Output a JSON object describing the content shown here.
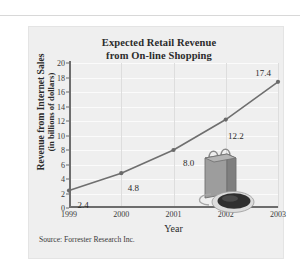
{
  "page": {
    "background_color": "#ffffff",
    "panel_color": "#efefef",
    "divider_color": "#d8d8d8"
  },
  "figure": {
    "source_note": "Source: Forrester Research Inc.",
    "illustration_name": "shopping-bag-and-computer-mouse",
    "illustration_colors": {
      "bag": "#9a9a9a",
      "bag_side": "#7d7d7d",
      "mouse": "#2e2e2e",
      "mouse_rim": "#d0d0d0"
    }
  },
  "chart_data": {
    "type": "line",
    "title": "Expected Retail Revenue from On-line Shopping",
    "title_line1": "Expected Retail Revenue",
    "title_line2": "from On-line Shopping",
    "xlabel": "Year",
    "ylabel": "Revenue from Internet Sales",
    "ylabel_line1": "Revenue from Internet Sales",
    "ylabel_line2": "(in billions of dollars)",
    "x": [
      "1999",
      "2000",
      "2001",
      "2002",
      "2003"
    ],
    "categories": [
      "1999",
      "2000",
      "2001",
      "2002",
      "2003"
    ],
    "values": [
      2.4,
      4.8,
      8.0,
      12.2,
      17.4
    ],
    "point_labels": [
      "2.4",
      "4.8",
      "8.0",
      "12.2",
      "17.4"
    ],
    "xtick_labels": [
      "1999",
      "2000",
      "2001",
      "2002",
      "2003"
    ],
    "ytick_labels": [
      "0",
      "2",
      "4",
      "6",
      "8",
      "10",
      "12",
      "14",
      "16",
      "18",
      "20"
    ],
    "ytick_values": [
      0,
      2,
      4,
      6,
      8,
      10,
      12,
      14,
      16,
      18,
      20
    ],
    "ylim": [
      0,
      20
    ],
    "xlim": [
      "1999",
      "2003"
    ],
    "grid": "horizontal-and-vertical",
    "legend": "none",
    "line_color": "#6f6f6f",
    "marker_color": "#6a6a6a",
    "units": "billions of dollars"
  }
}
